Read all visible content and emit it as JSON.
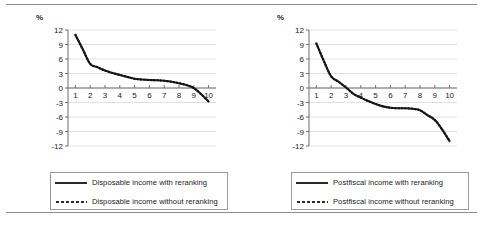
{
  "figure": {
    "background": "#ffffff",
    "ink": "#2b2b2b",
    "grid_color": "#d8d8d8",
    "axis_color": "#6e6e6e"
  },
  "chart_data": [
    {
      "type": "line",
      "panel": "left",
      "title": "",
      "xlabel": "",
      "ylabel": "%",
      "ylim": [
        -12,
        12
      ],
      "yticks": [
        12,
        9,
        6,
        3,
        0,
        -3,
        -6,
        -9,
        -12
      ],
      "ytick_labels": [
        "12",
        "9",
        "6",
        "3",
        "0",
        "-3",
        "-6",
        "-9",
        "-12"
      ],
      "xlim": [
        0.5,
        10.5
      ],
      "xticks": [
        1,
        2,
        3,
        4,
        5,
        6,
        7,
        8,
        9,
        10
      ],
      "xtick_labels": [
        "1",
        "2",
        "3",
        "4",
        "5",
        "6",
        "7",
        "8",
        "9",
        "10"
      ],
      "grid": true,
      "legend_position": "below",
      "series": [
        {
          "name": "Disposable income with reranking",
          "style": "solid",
          "x": [
            1,
            1.5,
            2,
            2.5,
            3,
            3.5,
            4,
            4.5,
            5,
            5.5,
            6,
            6.5,
            7,
            7.5,
            8,
            8.5,
            9,
            9.5,
            10
          ],
          "values": [
            11.0,
            8.0,
            5.0,
            4.3,
            3.6,
            3.1,
            2.7,
            2.3,
            1.9,
            1.75,
            1.65,
            1.6,
            1.5,
            1.3,
            1.0,
            0.6,
            0.0,
            -1.3,
            -2.8
          ]
        },
        {
          "name": "Disposable income without reranking",
          "style": "dotted",
          "x": [
            1,
            1.5,
            2,
            2.5,
            3,
            3.5,
            4,
            4.5,
            5,
            5.5,
            6,
            6.5,
            7,
            7.5,
            8,
            8.5,
            9,
            9.5,
            10
          ],
          "values": [
            11.0,
            8.0,
            5.0,
            4.3,
            3.6,
            3.1,
            2.7,
            2.3,
            1.9,
            1.75,
            1.65,
            1.6,
            1.5,
            1.3,
            1.0,
            0.6,
            0.0,
            -1.3,
            -2.8
          ]
        }
      ]
    },
    {
      "type": "line",
      "panel": "right",
      "title": "",
      "xlabel": "",
      "ylabel": "%",
      "ylim": [
        -12,
        12
      ],
      "yticks": [
        12,
        9,
        6,
        3,
        0,
        -3,
        -6,
        -9,
        -12
      ],
      "ytick_labels": [
        "12",
        "9",
        "6",
        "3",
        "0",
        "-3",
        "-6",
        "-9",
        "-12"
      ],
      "xlim": [
        0.5,
        10.5
      ],
      "xticks": [
        1,
        2,
        3,
        4,
        5,
        6,
        7,
        8,
        9,
        10
      ],
      "xtick_labels": [
        "1",
        "2",
        "3",
        "4",
        "5",
        "6",
        "7",
        "8",
        "9",
        "10"
      ],
      "grid": true,
      "legend_position": "below",
      "series": [
        {
          "name": "Postfiscal income with reranking",
          "style": "solid",
          "x": [
            1,
            1.5,
            2,
            2.5,
            3,
            3.5,
            4,
            4.5,
            5,
            5.5,
            6,
            6.5,
            7,
            7.5,
            8,
            8.5,
            9,
            9.5,
            10
          ],
          "values": [
            9.2,
            5.6,
            2.4,
            1.3,
            0.1,
            -1.2,
            -2.0,
            -2.7,
            -3.3,
            -3.8,
            -4.1,
            -4.2,
            -4.2,
            -4.3,
            -4.6,
            -5.6,
            -6.6,
            -8.6,
            -11.0
          ]
        },
        {
          "name": "Postfiscal income without reranking",
          "style": "dotted",
          "x": [
            1,
            1.5,
            2,
            2.5,
            3,
            3.5,
            4,
            4.5,
            5,
            5.5,
            6,
            6.5,
            7,
            7.5,
            8,
            8.5,
            9,
            9.5,
            10
          ],
          "values": [
            9.2,
            5.6,
            2.4,
            1.3,
            0.1,
            -1.2,
            -2.0,
            -2.7,
            -3.3,
            -3.8,
            -4.1,
            -4.2,
            -4.2,
            -4.3,
            -4.6,
            -5.6,
            -6.6,
            -8.6,
            -11.0
          ]
        }
      ]
    }
  ],
  "left_panel": {
    "axis_unit_label": "%",
    "legend": [
      {
        "label": "Disposable income with reranking",
        "style": "solid"
      },
      {
        "label": "Disposable income without reranking",
        "style": "dotted"
      }
    ]
  },
  "right_panel": {
    "axis_unit_label": "%",
    "legend": [
      {
        "label": "Postfiscal income with reranking",
        "style": "solid"
      },
      {
        "label": "Postfiscal income without reranking",
        "style": "dotted"
      }
    ]
  }
}
